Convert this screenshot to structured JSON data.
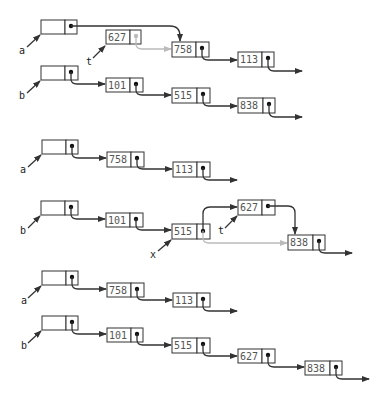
{
  "diagram": {
    "colors": {
      "line": "#333333",
      "faded": "#bbbbbb",
      "text": "#555555"
    },
    "sections": [
      {
        "id": "step1",
        "heads": [
          {
            "name": "a",
            "x": 41,
            "y": 20
          },
          {
            "name": "t",
            "x": 106,
            "y": 30,
            "value": "627",
            "faded_pointer": true
          },
          {
            "name": "b",
            "x": 41,
            "y": 66
          }
        ],
        "nodes": [
          {
            "value": "758",
            "x": 172,
            "y": 42
          },
          {
            "value": "113",
            "x": 238,
            "y": 52
          },
          {
            "value": "101",
            "x": 106,
            "y": 78
          },
          {
            "value": "515",
            "x": 172,
            "y": 88
          },
          {
            "value": "838",
            "x": 238,
            "y": 98
          }
        ]
      },
      {
        "id": "step2",
        "heads": [
          {
            "name": "a",
            "x": 42,
            "y": 140
          },
          {
            "name": "b",
            "x": 41,
            "y": 201
          },
          {
            "name": "x",
            "target": "515"
          },
          {
            "name": "t",
            "target": "627"
          }
        ],
        "nodes": [
          {
            "value": "758",
            "x": 107,
            "y": 152
          },
          {
            "value": "113",
            "x": 173,
            "y": 162
          },
          {
            "value": "101",
            "x": 106,
            "y": 213
          },
          {
            "value": "515",
            "x": 172,
            "y": 224
          },
          {
            "value": "627",
            "x": 238,
            "y": 200
          },
          {
            "value": "838",
            "x": 288,
            "y": 235
          }
        ]
      },
      {
        "id": "step3",
        "heads": [
          {
            "name": "a",
            "x": 42,
            "y": 271
          },
          {
            "name": "b",
            "x": 42,
            "y": 316
          }
        ],
        "nodes": [
          {
            "value": "758",
            "x": 107,
            "y": 283
          },
          {
            "value": "113",
            "x": 173,
            "y": 293
          },
          {
            "value": "101",
            "x": 107,
            "y": 328
          },
          {
            "value": "515",
            "x": 172,
            "y": 338
          },
          {
            "value": "627",
            "x": 238,
            "y": 349
          },
          {
            "value": "838",
            "x": 305,
            "y": 361
          }
        ]
      }
    ],
    "labels": {
      "s1_a": "a",
      "s1_t": "t",
      "s1_b": "b",
      "s2_a": "a",
      "s2_b": "b",
      "s2_x": "x",
      "s2_t": "t",
      "s3_a": "a",
      "s3_b": "b"
    },
    "values": {
      "s1_627": "627",
      "s1_758": "758",
      "s1_113": "113",
      "s1_101": "101",
      "s1_515": "515",
      "s1_838": "838",
      "s2_758": "758",
      "s2_113": "113",
      "s2_101": "101",
      "s2_515": "515",
      "s2_627": "627",
      "s2_838": "838",
      "s3_758": "758",
      "s3_113": "113",
      "s3_101": "101",
      "s3_515": "515",
      "s3_627": "627",
      "s3_838": "838"
    }
  }
}
